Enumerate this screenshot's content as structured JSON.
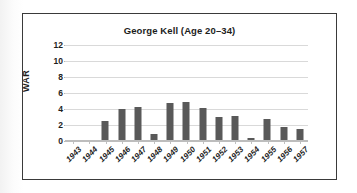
{
  "chart_data": {
    "type": "bar",
    "title": "George Kell (Age 20–34)",
    "xlabel": "",
    "ylabel": "WAR",
    "categories": [
      "1943",
      "1944",
      "1945",
      "1946",
      "1947",
      "1948",
      "1949",
      "1950",
      "1951",
      "1952",
      "1953",
      "1954",
      "1955",
      "1956",
      "1957"
    ],
    "values": [
      0.1,
      0,
      2.5,
      4.0,
      4.2,
      0.9,
      4.8,
      4.9,
      4.1,
      3.0,
      3.1,
      0.4,
      2.7,
      1.8,
      1.5
    ],
    "ylim": [
      0,
      12
    ],
    "yticks": [
      0,
      2,
      4,
      6,
      8,
      10,
      12
    ],
    "ytick_labels": [
      "0",
      "2",
      "4",
      "6",
      "8",
      "10",
      "12"
    ],
    "grid": true,
    "legend": false,
    "bar_color": "#595959",
    "gridline_color": "#d9d9d9",
    "border_color": "#3a3a3a",
    "plot_background": "#ffffff"
  }
}
